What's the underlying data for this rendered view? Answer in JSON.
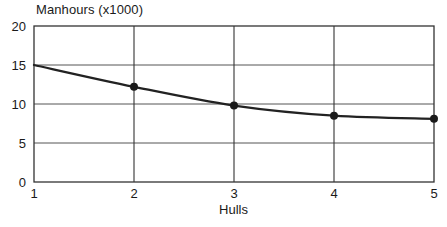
{
  "chart_data": {
    "type": "line",
    "title": "Manhours (x1000)",
    "xlabel": "Hulls",
    "ylabel": "",
    "x": [
      1,
      2,
      3,
      4,
      5
    ],
    "values": [
      15.0,
      12.2,
      9.8,
      8.5,
      8.1
    ],
    "series": [
      {
        "name": "Manhours",
        "values": [
          15.0,
          12.2,
          9.8,
          8.5,
          8.1
        ],
        "color": "#222222",
        "marker": "circle"
      }
    ],
    "xlim": [
      1,
      5
    ],
    "ylim": [
      0,
      20
    ],
    "xticks": [
      1,
      2,
      3,
      4,
      5
    ],
    "yticks": [
      0,
      5,
      10,
      15,
      20
    ],
    "xtick_labels": [
      "1",
      "2",
      "3",
      "4",
      "5"
    ],
    "ytick_labels": [
      "0",
      "5",
      "10",
      "15",
      "20"
    ],
    "grid": {
      "horizontal": true,
      "vertical": true,
      "color": "#555555"
    },
    "legend": {
      "visible": false,
      "position": "none"
    },
    "plot_border_color": "#333333",
    "background_color": "#ffffff",
    "annotations": []
  }
}
